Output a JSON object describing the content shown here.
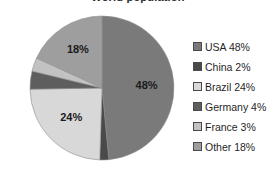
{
  "chart_data": {
    "type": "pie",
    "title": "World population",
    "categories": [
      "USA",
      "China",
      "Brazil",
      "Germany",
      "France",
      "Other"
    ],
    "values": [
      48,
      2,
      24,
      4,
      3,
      18
    ],
    "value_unit": "%",
    "slice_labels": [
      "48%",
      "2%",
      "24%",
      "4%",
      "3%",
      "18%"
    ],
    "colors": [
      "#7a7a7a",
      "#4a4a4a",
      "#d8d8d8",
      "#5e5e5e",
      "#c2c2c2",
      "#9e9e9e"
    ],
    "legend_entries": [
      "USA 48%",
      "China 2%",
      "Brazil 24%",
      "Germany 4%",
      "France 3%",
      "Other 18%"
    ],
    "legend_position": "right",
    "start_angle_deg": 0,
    "direction": "clockwise",
    "grid": false
  },
  "labels": {
    "usa": "48%",
    "china": "2%",
    "brazil": "24%",
    "germany": "4%",
    "france": "3%",
    "other": "18%"
  },
  "legend": {
    "items": [
      {
        "label": "USA 48%",
        "color": "#7a7a7a"
      },
      {
        "label": "China 2%",
        "color": "#4a4a4a"
      },
      {
        "label": "Brazil 24%",
        "color": "#d8d8d8"
      },
      {
        "label": "Germany 4%",
        "color": "#5e5e5e"
      },
      {
        "label": "France 3%",
        "color": "#c2c2c2"
      },
      {
        "label": "Other 18%",
        "color": "#9e9e9e"
      }
    ]
  }
}
